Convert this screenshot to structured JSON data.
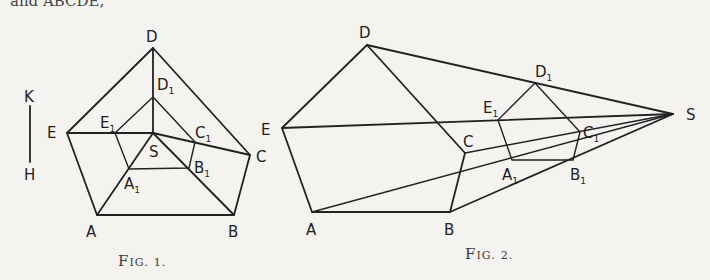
{
  "top_text_fragment": "and ABCDE,",
  "figures": [
    {
      "id": "fig1",
      "caption": "Fig. 1.",
      "caption_parts": {
        "F": "F",
        "rest": "IG.",
        "num": "1."
      },
      "scale_bar": {
        "top_label": "K",
        "bottom_label": "H"
      },
      "points": {
        "D": {
          "label": "D",
          "sub": ""
        },
        "D1": {
          "label": "D",
          "sub": "1"
        },
        "E": {
          "label": "E",
          "sub": ""
        },
        "E1": {
          "label": "E",
          "sub": "1"
        },
        "S": {
          "label": "S",
          "sub": ""
        },
        "C1": {
          "label": "C",
          "sub": "1"
        },
        "C": {
          "label": "C",
          "sub": ""
        },
        "B1": {
          "label": "B",
          "sub": "1"
        },
        "A1": {
          "label": "A",
          "sub": "1"
        },
        "A": {
          "label": "A",
          "sub": ""
        },
        "B": {
          "label": "B",
          "sub": ""
        }
      }
    },
    {
      "id": "fig2",
      "caption": "Fig. 2.",
      "caption_parts": {
        "F": "F",
        "rest": "IG.",
        "num": "2."
      },
      "points": {
        "D": {
          "label": "D",
          "sub": ""
        },
        "D1": {
          "label": "D",
          "sub": "1"
        },
        "E": {
          "label": "E",
          "sub": ""
        },
        "E1": {
          "label": "E",
          "sub": "1"
        },
        "C": {
          "label": "C",
          "sub": ""
        },
        "C1": {
          "label": "C",
          "sub": "1"
        },
        "A1": {
          "label": "A",
          "sub": "1"
        },
        "B1": {
          "label": "B",
          "sub": "1"
        },
        "A": {
          "label": "A",
          "sub": ""
        },
        "B": {
          "label": "B",
          "sub": ""
        },
        "S": {
          "label": "S",
          "sub": ""
        }
      }
    }
  ]
}
